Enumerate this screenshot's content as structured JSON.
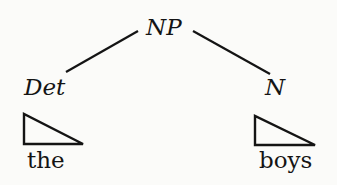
{
  "diagram": {
    "type": "syntax-tree",
    "root": {
      "label": "NP"
    },
    "children": [
      {
        "label": "Det",
        "word": "the",
        "triangle": true
      },
      {
        "label": "N",
        "word": "boys",
        "triangle": true
      }
    ],
    "colors": {
      "ink": "#141414",
      "background": "#fbfbf9"
    }
  }
}
